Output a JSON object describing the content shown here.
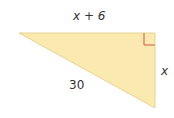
{
  "diagram": {
    "type": "right-triangle",
    "fill_color": "#fbeab0",
    "stroke_color": "#e8d9a0",
    "right_angle_marker_color": "#d9534f",
    "labels": {
      "top": "x + 6",
      "right": "x",
      "hypotenuse": "30"
    }
  }
}
